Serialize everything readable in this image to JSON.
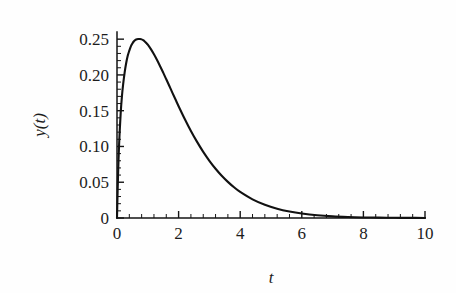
{
  "figure": {
    "background_color": "#fefefe",
    "ink_color": "#111111"
  },
  "chart_data": {
    "type": "line",
    "title": "",
    "subtitle": "",
    "xlabel": "t",
    "ylabel": "y(t)",
    "xlim": [
      0,
      10
    ],
    "ylim": [
      0,
      0.26
    ],
    "grid": false,
    "legend": null,
    "legend_position": "none",
    "x_major_ticks": [
      0,
      2,
      4,
      6,
      8,
      10
    ],
    "x_major_tick_labels": [
      "0",
      "2",
      "4",
      "6",
      "8",
      "10"
    ],
    "x_minor_tick_step": 0.4,
    "y_major_ticks": [
      0,
      0.05,
      0.1,
      0.15,
      0.2,
      0.25
    ],
    "y_major_tick_labels": [
      "0",
      "0.05",
      "0.10",
      "0.15",
      "0.20",
      "0.25"
    ],
    "y_minor_tick_step": 0.01,
    "axis_style": "left-and-bottom-spines-only-inward-ticks",
    "annotations": [],
    "series": [
      {
        "name": "y(t)",
        "color": "#111111",
        "peak_x": 0.75,
        "peak_y": 0.25,
        "x": [
          0,
          0.02,
          0.05,
          0.08,
          0.12,
          0.16,
          0.2,
          0.25,
          0.3,
          0.35,
          0.4,
          0.45,
          0.5,
          0.55,
          0.6,
          0.65,
          0.7,
          0.75,
          0.8,
          0.85,
          0.9,
          0.95,
          1.0,
          1.1,
          1.2,
          1.3,
          1.4,
          1.5,
          1.6,
          1.7,
          1.8,
          1.9,
          2.0,
          2.2,
          2.4,
          2.6,
          2.8,
          3.0,
          3.2,
          3.4,
          3.6,
          3.8,
          4.0,
          4.4,
          4.8,
          5.2,
          5.6,
          6.0,
          6.5,
          7.0,
          7.5,
          8.0,
          8.5,
          9.0,
          9.5,
          10.0
        ],
        "y": [
          0,
          0.037,
          0.082,
          0.114,
          0.147,
          0.17,
          0.187,
          0.204,
          0.217,
          0.227,
          0.234,
          0.24,
          0.244,
          0.247,
          0.249,
          0.25,
          0.2502,
          0.2503,
          0.2497,
          0.2485,
          0.2468,
          0.2447,
          0.2422,
          0.236,
          0.2288,
          0.2208,
          0.2122,
          0.2032,
          0.1939,
          0.1845,
          0.175,
          0.1656,
          0.1563,
          0.1384,
          0.1217,
          0.1064,
          0.0925,
          0.08,
          0.0689,
          0.0591,
          0.0505,
          0.0429,
          0.0364,
          0.026,
          0.0184,
          0.0129,
          0.009,
          0.0062,
          0.0038,
          0.0023,
          0.0014,
          0.0008,
          0.0005,
          0.0003,
          0.0002,
          0.0001
        ]
      }
    ]
  },
  "layout": {
    "plot_left_px": 117,
    "plot_right_px": 425,
    "plot_top_px": 32,
    "plot_bottom_px": 218
  }
}
